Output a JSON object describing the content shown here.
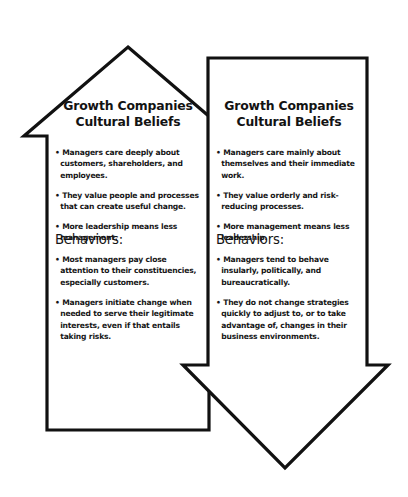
{
  "figure": {
    "background_color": "#ffffff",
    "stroke_color": "#111111",
    "left_arrow_icon": "up-arrow-outline-icon",
    "right_arrow_icon": "down-arrow-outline-icon"
  },
  "left_column": {
    "heading_line_1": "Growth Companies",
    "heading_line_2": "Cultural Beliefs",
    "beliefs": [
      "• Managers care deeply about customers, shareholders, and employees.",
      "• They value people and processes that can create useful change.",
      "• More leadership means less management."
    ],
    "behaviors_heading": "Behaviors:",
    "behaviors": [
      "• Most managers pay close attention to their constituencies, especially customers.",
      "• Managers initiate change when needed to serve their legitimate interests, even if that entails taking risks."
    ]
  },
  "right_column": {
    "heading_line_1": "Growth Companies",
    "heading_line_2": "Cultural Beliefs",
    "beliefs": [
      "• Managers care mainly about themselves and their immediate work.",
      "• They value orderly and risk-reducing processes.",
      "• More management means less leadership."
    ],
    "behaviors_heading": "Behaviors:",
    "behaviors": [
      "• Managers tend to behave insularly, politically, and bureaucratically.",
      "• They do not change strategies quickly to adjust to, or to take advantage of, changes in their business environments."
    ]
  }
}
